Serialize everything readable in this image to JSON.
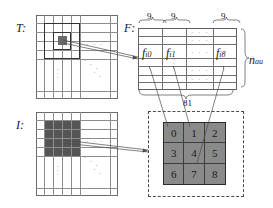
{
  "figure": {
    "labels": {
      "template": "T:",
      "features": "F:",
      "image": "I:",
      "rows_label": "n",
      "rows_label_sub": "au"
    },
    "feature_table": {
      "segment_counts": [
        "9",
        "9",
        "9"
      ],
      "total_label": "81",
      "cell_labels": [
        "f",
        "f",
        "f"
      ],
      "cell_label_subs": [
        "i0",
        "i1",
        "i8"
      ],
      "cell_label_full": [
        "f i0",
        "f i1",
        "f i8"
      ],
      "ellipsis": "· · ·",
      "vertical_ellipsis": "·\n·\n·"
    },
    "patch": {
      "values": [
        "0",
        "1",
        "2",
        "3",
        "4",
        "5",
        "6",
        "7",
        "8"
      ],
      "fill_color": "#8a8a8a",
      "border_color": "#2b2b2b"
    },
    "template_grid": {
      "ellipsis": "· · ·",
      "vertical_ellipsis": "·\n·\n·"
    },
    "image_grid": {
      "ellipsis": "· · ·",
      "vertical_ellipsis": "·\n·\n·"
    }
  }
}
